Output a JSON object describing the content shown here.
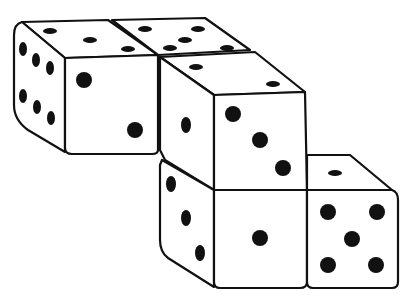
{
  "illustration": {
    "title": "",
    "subject": "stacked-dice-line-drawing",
    "colors": {
      "ink": "#111111",
      "paper": "#ffffff"
    },
    "dice": [
      {
        "id": "die-top-left",
        "faces": {
          "top": 3,
          "front": 2,
          "left": 6
        }
      },
      {
        "id": "die-top-back",
        "faces": {
          "top": 5
        }
      },
      {
        "id": "die-middle",
        "faces": {
          "top": 2,
          "front": 3,
          "left": 1
        }
      },
      {
        "id": "die-bottom-middle",
        "faces": {
          "front": 1,
          "left": 3
        }
      },
      {
        "id": "die-bottom-right",
        "faces": {
          "top": 1,
          "front": 5
        }
      }
    ]
  }
}
